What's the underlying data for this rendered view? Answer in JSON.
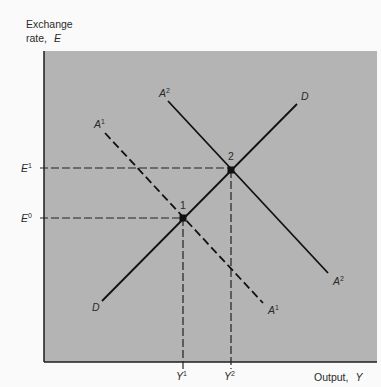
{
  "diagram": {
    "y_axis_label_line1": "Exchange",
    "y_axis_label_line2": "rate,",
    "y_axis_symbol": "E",
    "x_axis_label": "Output,",
    "x_axis_symbol": "Y",
    "background_color": "#b4b4b4",
    "curves": [
      {
        "name": "DD",
        "label": "D",
        "style": "solid",
        "from": [
          102,
          301
        ],
        "to": [
          297,
          104
        ]
      },
      {
        "name": "AA2",
        "label": "A",
        "sup": "2",
        "style": "solid",
        "from": [
          168,
          101
        ],
        "to": [
          328,
          273
        ]
      },
      {
        "name": "AA1",
        "label": "A",
        "sup": "1",
        "style": "dashed",
        "from": [
          105,
          133
        ],
        "to": [
          263,
          303
        ]
      }
    ],
    "points": [
      {
        "label": "1",
        "x": 183,
        "y": 218
      },
      {
        "label": "2",
        "x": 231,
        "y": 170
      }
    ],
    "y_ticks": [
      {
        "base": "E",
        "sup": "1",
        "y": 168
      },
      {
        "base": "E",
        "sup": "0",
        "y": 218
      }
    ],
    "x_ticks": [
      {
        "base": "Y",
        "sup": "1",
        "x": 183
      },
      {
        "base": "Y",
        "sup": "2",
        "x": 231
      }
    ],
    "curve_labels": {
      "d_top": "D",
      "d_bottom": "D",
      "a2_top": "A",
      "a2_top_sup": "2",
      "a2_bottom": "A",
      "a2_bottom_sup": "2",
      "a1_top": "A",
      "a1_top_sup": "1",
      "a1_bottom": "A",
      "a1_bottom_sup": "1"
    },
    "point_labels": {
      "p1": "1",
      "p2": "2"
    }
  }
}
